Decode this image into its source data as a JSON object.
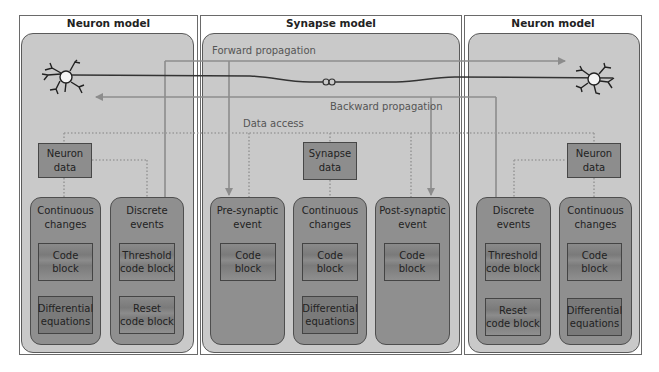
{
  "diagram": {
    "columns": [
      {
        "id": "left-neuron",
        "title": "Neuron model"
      },
      {
        "id": "synapse",
        "title": "Synapse model"
      },
      {
        "id": "right-neuron",
        "title": "Neuron model"
      }
    ],
    "flows": {
      "forward": "Forward propagation",
      "backward": "Backward propagation",
      "data_access": "Data access"
    },
    "left_neuron": {
      "data_box": "Neuron\ndata",
      "groups": [
        {
          "title": "Continuous\nchanges",
          "blocks": [
            "Code block",
            "Differential\nequations"
          ]
        },
        {
          "title": "Discrete\nevents",
          "blocks": [
            "Threshold\ncode block",
            "Reset\ncode block"
          ]
        }
      ]
    },
    "synapse": {
      "data_box": "Synapse\ndata",
      "groups": [
        {
          "title": "Pre-synaptic\nevent",
          "blocks": [
            "Code block"
          ]
        },
        {
          "title": "Continuous\nchanges",
          "blocks": [
            "Code block",
            "Differential\nequations"
          ]
        },
        {
          "title": "Post-synaptic\nevent",
          "blocks": [
            "Code block"
          ]
        }
      ]
    },
    "right_neuron": {
      "data_box": "Neuron\ndata",
      "groups": [
        {
          "title": "Discrete\nevents",
          "blocks": [
            "Threshold\ncode block",
            "Reset\ncode block"
          ]
        },
        {
          "title": "Continuous\nchanges",
          "blocks": [
            "Code block",
            "Differential\nequations"
          ]
        }
      ]
    },
    "synapse_symbol": "oo",
    "colors": {
      "panel": "#c9c9c9",
      "group": "#8f8f8f",
      "block": "#7f7f7f",
      "line_dark": "#3a3a3a",
      "line_arrow": "#8c8c8c",
      "dotted": "#9a9a9a"
    }
  }
}
